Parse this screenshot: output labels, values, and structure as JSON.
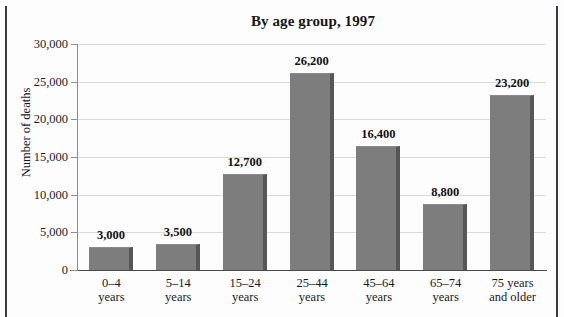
{
  "chart_data": {
    "type": "bar",
    "title": "By age group, 1997",
    "xlabel": "",
    "ylabel": "Number of deaths",
    "categories": [
      "0–4 years",
      "5–14 years",
      "15–24 years",
      "25–44 years",
      "45–64 years",
      "65–74 years",
      "75 years and older"
    ],
    "category_lines": [
      [
        "0–4",
        "years"
      ],
      [
        "5–14",
        "years"
      ],
      [
        "15–24",
        "years"
      ],
      [
        "25–44",
        "years"
      ],
      [
        "45–64",
        "years"
      ],
      [
        "65–74",
        "years"
      ],
      [
        "75 years",
        "and older"
      ]
    ],
    "values": [
      3000,
      3500,
      12700,
      26200,
      16400,
      8800,
      23200
    ],
    "value_labels": [
      "3,000",
      "3,500",
      "12,700",
      "26,200",
      "16,400",
      "8,800",
      "23,200"
    ],
    "ylim": [
      0,
      30000
    ],
    "yticks": [
      0,
      5000,
      10000,
      15000,
      20000,
      25000,
      30000
    ],
    "ytick_labels": [
      "0",
      "5,000",
      "10,000",
      "15,000",
      "20,000",
      "25,000",
      "30,000"
    ],
    "grid": true,
    "legend": false,
    "bar_color": "#7d7d7d",
    "bar_shadow_color": "#565656",
    "gridline_color": "#dcdcdc",
    "axis_color": "#4a4a4a",
    "text_color": "#17171a"
  }
}
